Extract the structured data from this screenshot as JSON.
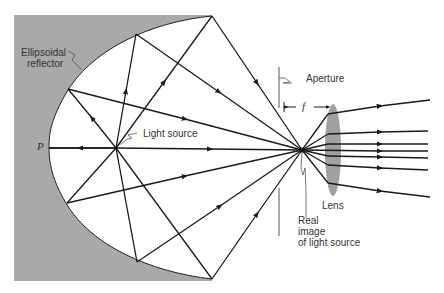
{
  "figure": {
    "labels": {
      "reflector": [
        "Ellipsoidal",
        "reflector"
      ],
      "point_p": "P",
      "light_source": "Light source",
      "aperture": "Aperture",
      "focal_length": "f",
      "lens": "Lens",
      "real_image": [
        "Real",
        "image",
        "of light source"
      ]
    },
    "colors": {
      "reflector_fill": "#a9a9a9",
      "lens_fill": "#a0a0a0",
      "ray": "#1a1a1a",
      "background": "#ffffff"
    }
  }
}
